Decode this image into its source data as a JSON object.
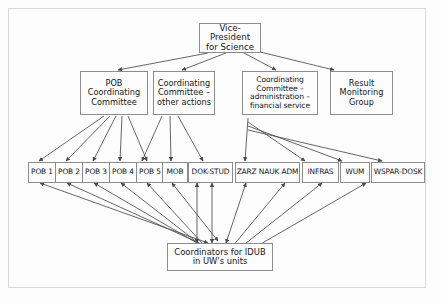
{
  "diagram": {
    "type": "organizational-hierarchy",
    "title_text": "",
    "colors": {
      "box_border": "#8c8c8c",
      "frame_border": "#d8d8d8",
      "background": "#fdfdfd",
      "text": "#15171a",
      "connector": "#4a4a4a"
    },
    "tier1": {
      "vice_president": "Vice-President\nfor Science"
    },
    "tier2": [
      {
        "id": "pob-coordinating-committee",
        "label": "POB\nCoordinating\nCommittee"
      },
      {
        "id": "coordinating-committee-other-actions",
        "label": "Coordinating\nCommittee –\nother actions"
      },
      {
        "id": "coordinating-committee-administration-financial-service",
        "label": "Coordinating\nCommittee –\nadministration –\nfinancial service"
      },
      {
        "id": "result-monitoring-group",
        "label": "Result\nMonitoring\nGroup"
      }
    ],
    "tier3": [
      {
        "id": "pob-1",
        "label": "POB 1"
      },
      {
        "id": "pob-2",
        "label": "POB 2"
      },
      {
        "id": "pob-3",
        "label": "POB 3"
      },
      {
        "id": "pob-4",
        "label": "POB 4"
      },
      {
        "id": "pob-5",
        "label": "POB 5"
      },
      {
        "id": "mob",
        "label": "MOB"
      },
      {
        "id": "dok-stud",
        "label": "DOK-STUD"
      },
      {
        "id": "zarz-nauk-adm",
        "label": "ZARZ NAUK ADM"
      },
      {
        "id": "infras",
        "label": "INFRAS"
      },
      {
        "id": "wum",
        "label": "WUM"
      },
      {
        "id": "wspar-dosk",
        "label": "WSPAR-DOSK"
      }
    ],
    "tier4": {
      "coordinators": "Coordinators for IDUB\nin UW's units"
    }
  }
}
